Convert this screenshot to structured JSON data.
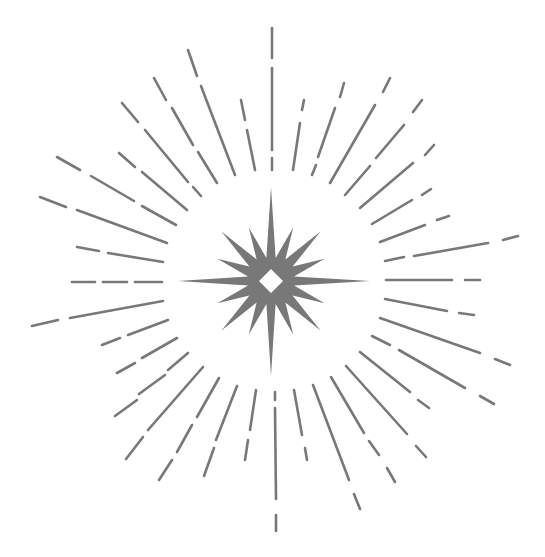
{
  "illustration": {
    "title": "Starburst with radiating dashed rays",
    "width": 545,
    "height": 557,
    "background": "#ffffff",
    "color": "#787878",
    "stroke_width": 2.6,
    "star": {
      "center": [
        271,
        281
      ],
      "long_points": [
        [
          271,
          187
        ],
        [
          370,
          281
        ],
        [
          273,
          376
        ],
        [
          178,
          281
        ]
      ],
      "diag_radius": 70,
      "mid_radius": 58,
      "inner_radius": 26,
      "hole_radius": 12
    },
    "rays": [
      [
        [
          272,
          28
        ],
        [
          272,
          58
        ]
      ],
      [
        [
          272,
          68
        ],
        [
          272,
          150
        ]
      ],
      [
        [
          272,
          158
        ],
        [
          272,
          170
        ]
      ],
      [
        [
          188,
          50
        ],
        [
          197,
          76
        ]
      ],
      [
        [
          201,
          86
        ],
        [
          235,
          175
        ]
      ],
      [
        [
          154,
          78
        ],
        [
          166,
          100
        ]
      ],
      [
        [
          172,
          108
        ],
        [
          193,
          145
        ]
      ],
      [
        [
          198,
          152
        ],
        [
          217,
          183
        ]
      ],
      [
        [
          122,
          103
        ],
        [
          138,
          122
        ]
      ],
      [
        [
          145,
          130
        ],
        [
          188,
          182
        ]
      ],
      [
        [
          193,
          187
        ],
        [
          201,
          196
        ]
      ],
      [
        [
          241,
          100
        ],
        [
          245,
          120
        ]
      ],
      [
        [
          247,
          130
        ],
        [
          255,
          170
        ]
      ],
      [
        [
          57,
          157
        ],
        [
          80,
          170
        ]
      ],
      [
        [
          91,
          176
        ],
        [
          134,
          201
        ]
      ],
      [
        [
          142,
          206
        ],
        [
          176,
          225
        ]
      ],
      [
        [
          119,
          153
        ],
        [
          135,
          167
        ]
      ],
      [
        [
          142,
          172
        ],
        [
          187,
          210
        ]
      ],
      [
        [
          40,
          197
        ],
        [
          66,
          207
        ]
      ],
      [
        [
          77,
          210
        ],
        [
          167,
          243
        ]
      ],
      [
        [
          77,
          247
        ],
        [
          99,
          251
        ]
      ],
      [
        [
          108,
          253
        ],
        [
          163,
          262
        ]
      ],
      [
        [
          304,
          100
        ],
        [
          302,
          110
        ]
      ],
      [
        [
          300,
          123
        ],
        [
          293,
          170
        ]
      ],
      [
        [
          344,
          83
        ],
        [
          340,
          97
        ]
      ],
      [
        [
          335,
          108
        ],
        [
          318,
          157
        ]
      ],
      [
        [
          316,
          165
        ],
        [
          312,
          175
        ]
      ],
      [
        [
          390,
          78
        ],
        [
          383,
          92
        ]
      ],
      [
        [
          375,
          105
        ],
        [
          330,
          183
        ]
      ],
      [
        [
          422,
          100
        ],
        [
          413,
          112
        ]
      ],
      [
        [
          404,
          125
        ],
        [
          376,
          158
        ]
      ],
      [
        [
          370,
          166
        ],
        [
          345,
          195
        ]
      ],
      [
        [
          434,
          145
        ],
        [
          425,
          155
        ]
      ],
      [
        [
          413,
          163
        ],
        [
          360,
          208
        ]
      ],
      [
        [
          431,
          189
        ],
        [
          422,
          195
        ]
      ],
      [
        [
          412,
          200
        ],
        [
          372,
          224
        ]
      ],
      [
        [
          449,
          216
        ],
        [
          437,
          220
        ]
      ],
      [
        [
          425,
          225
        ],
        [
          380,
          242
        ]
      ],
      [
        [
          518,
          236
        ],
        [
          503,
          240
        ]
      ],
      [
        [
          488,
          243
        ],
        [
          414,
          256
        ]
      ],
      [
        [
          404,
          257
        ],
        [
          385,
          261
        ]
      ],
      [
        [
          386,
          280
        ],
        [
          452,
          280
        ]
      ],
      [
        [
          465,
          280
        ],
        [
          480,
          280
        ]
      ],
      [
        [
          385,
          299
        ],
        [
          447,
          311
        ]
      ],
      [
        [
          459,
          313
        ],
        [
          474,
          315
        ]
      ],
      [
        [
          380,
          318
        ],
        [
          480,
          353
        ]
      ],
      [
        [
          495,
          359
        ],
        [
          510,
          365
        ]
      ],
      [
        [
          372,
          336
        ],
        [
          390,
          345
        ]
      ],
      [
        [
          399,
          350
        ],
        [
          465,
          388
        ]
      ],
      [
        [
          480,
          396
        ],
        [
          494,
          404
        ]
      ],
      [
        [
          360,
          352
        ],
        [
          410,
          392
        ]
      ],
      [
        [
          418,
          400
        ],
        [
          429,
          408
        ]
      ],
      [
        [
          346,
          366
        ],
        [
          407,
          434
        ]
      ],
      [
        [
          416,
          446
        ],
        [
          426,
          457
        ]
      ],
      [
        [
          331,
          377
        ],
        [
          364,
          433
        ]
      ],
      [
        [
          369,
          441
        ],
        [
          379,
          455
        ]
      ],
      [
        [
          387,
          468
        ],
        [
          395,
          482
        ]
      ],
      [
        [
          313,
          385
        ],
        [
          349,
          480
        ]
      ],
      [
        [
          354,
          494
        ],
        [
          360,
          509
        ]
      ],
      [
        [
          294,
          390
        ],
        [
          302,
          435
        ]
      ],
      [
        [
          305,
          448
        ],
        [
          307,
          460
        ]
      ],
      [
        [
          275,
          392
        ],
        [
          275,
          400
        ]
      ],
      [
        [
          275,
          408
        ],
        [
          276,
          499
        ]
      ],
      [
        [
          276,
          515
        ],
        [
          276,
          531
        ]
      ],
      [
        [
          72,
          282
        ],
        [
          95,
          282
        ]
      ],
      [
        [
          103,
          282
        ],
        [
          127,
          282
        ]
      ],
      [
        [
          135,
          282
        ],
        [
          162,
          282
        ]
      ],
      [
        [
          32,
          326
        ],
        [
          58,
          320
        ]
      ],
      [
        [
          70,
          318
        ],
        [
          163,
          301
        ]
      ],
      [
        [
          102,
          345
        ],
        [
          120,
          338
        ]
      ],
      [
        [
          128,
          335
        ],
        [
          168,
          320
        ]
      ],
      [
        [
          117,
          373
        ],
        [
          135,
          363
        ]
      ],
      [
        [
          142,
          358
        ],
        [
          177,
          338
        ]
      ],
      [
        [
          115,
          416
        ],
        [
          137,
          400
        ]
      ],
      [
        [
          139,
          394
        ],
        [
          165,
          375
        ]
      ],
      [
        [
          168,
          370
        ],
        [
          188,
          353
        ]
      ],
      [
        [
          126,
          459
        ],
        [
          143,
          437
        ]
      ],
      [
        [
          148,
          430
        ],
        [
          203,
          367
        ]
      ],
      [
        [
          159,
          480
        ],
        [
          172,
          460
        ]
      ],
      [
        [
          177,
          452
        ],
        [
          192,
          425
        ]
      ],
      [
        [
          197,
          417
        ],
        [
          219,
          378
        ]
      ],
      [
        [
          204,
          476
        ],
        [
          214,
          448
        ]
      ],
      [
        [
          216,
          440
        ],
        [
          237,
          386
        ]
      ],
      [
        [
          245,
          460
        ],
        [
          248,
          440
        ]
      ],
      [
        [
          250,
          430
        ],
        [
          256,
          390
        ]
      ]
    ]
  }
}
